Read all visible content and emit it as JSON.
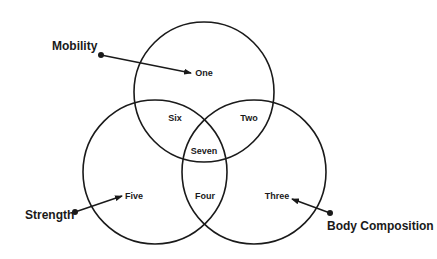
{
  "diagram": {
    "type": "venn-3",
    "stroke_color": "#1a1a1a",
    "background": "#ffffff",
    "circles": [
      {
        "id": "top",
        "cx": 204,
        "cy": 92,
        "r": 70
      },
      {
        "id": "left",
        "cx": 155,
        "cy": 172,
        "r": 72
      },
      {
        "id": "right",
        "cx": 254,
        "cy": 172,
        "r": 72
      }
    ],
    "categories": [
      {
        "label": "Mobility",
        "x": 52,
        "y": 50,
        "dot": [
          101,
          55
        ],
        "arrow_to": [
          191,
          73
        ]
      },
      {
        "label": "Strength",
        "x": 25,
        "y": 219,
        "dot": [
          75,
          212
        ],
        "arrow_to": [
          122,
          196
        ]
      },
      {
        "label": "Body Composition",
        "x": 327,
        "y": 230,
        "dot": [
          330,
          213
        ],
        "arrow_to": [
          292,
          199
        ]
      }
    ],
    "regions": [
      {
        "label": "One",
        "x": 204,
        "y": 76
      },
      {
        "label": "Two",
        "x": 249,
        "y": 121
      },
      {
        "label": "Three",
        "x": 277,
        "y": 199
      },
      {
        "label": "Four",
        "x": 205,
        "y": 199
      },
      {
        "label": "Five",
        "x": 134,
        "y": 199
      },
      {
        "label": "Six",
        "x": 175,
        "y": 121
      },
      {
        "label": "Seven",
        "x": 204,
        "y": 154
      }
    ]
  }
}
